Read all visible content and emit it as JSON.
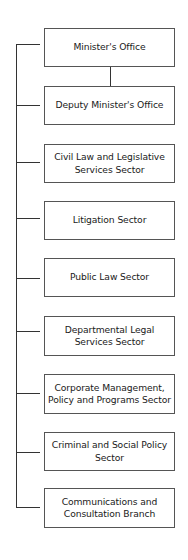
{
  "org_chart": {
    "root": "Minister's Office",
    "units": [
      {
        "label": "Minister's Office",
        "top": 28,
        "height": 39,
        "stub_y": 44
      },
      {
        "label": "Deputy Minister's Office",
        "top": 86,
        "height": 39,
        "stub_y": 105
      },
      {
        "label": "Civil Law and Legislative Services Sector",
        "top": 144,
        "height": 38,
        "stub_y": 162
      },
      {
        "label": "Litigation Sector",
        "top": 201,
        "height": 39,
        "stub_y": 218
      },
      {
        "label": "Public Law Sector",
        "top": 258,
        "height": 39,
        "stub_y": 278
      },
      {
        "label": "Departmental Legal Services Sector",
        "top": 316,
        "height": 40,
        "stub_y": 331
      },
      {
        "label": "Corporate Management, Policy and Programs Sector",
        "top": 374,
        "height": 39,
        "stub_y": 393
      },
      {
        "label": "Criminal and Social Policy Sector",
        "top": 432,
        "height": 39,
        "stub_y": 452
      },
      {
        "label": "Communications and Consultation Branch",
        "top": 488,
        "height": 40,
        "stub_y": 507
      }
    ]
  }
}
